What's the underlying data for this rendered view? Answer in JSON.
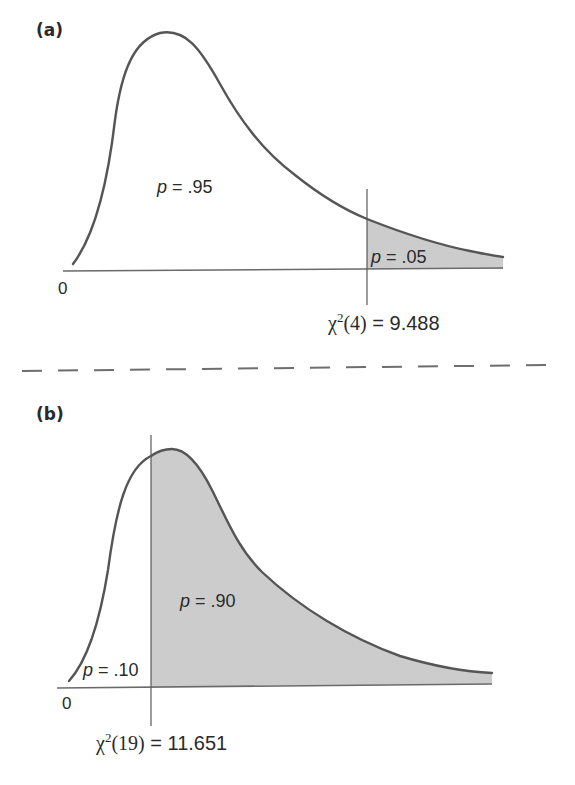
{
  "figure": {
    "divider": "dashed",
    "shade_color": "#cccccc",
    "curve_color": "#555555",
    "panels": [
      {
        "id": "a",
        "label": "(a)",
        "distribution": "chi-square",
        "df": 4,
        "origin_label": "0",
        "region_left": {
          "p_symbol": "p",
          "equals": " = ",
          "value": ".95"
        },
        "region_right": {
          "p_symbol": "p",
          "equals": " = ",
          "value": ".05",
          "shaded": true
        },
        "critical": {
          "chi": "χ",
          "sup": "2",
          "df_text": "(4)",
          "eq": " = ",
          "value": "9.488"
        }
      },
      {
        "id": "b",
        "label": "(b)",
        "distribution": "chi-square",
        "df": 19,
        "origin_label": "0",
        "region_left": {
          "p_symbol": "p",
          "equals": " = ",
          "value": ".10"
        },
        "region_right": {
          "p_symbol": "p",
          "equals": " = ",
          "value": ".90",
          "shaded": true
        },
        "critical": {
          "chi": "χ",
          "sup": "2",
          "df_text": "(19)",
          "eq": " = ",
          "value": "11.651"
        }
      }
    ]
  }
}
